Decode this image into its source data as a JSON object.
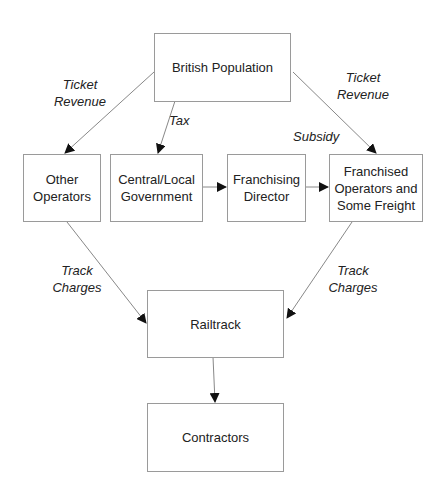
{
  "nodes": {
    "british_population": "British Population",
    "other_operators": "Other Operators",
    "government": "Central/Local Government",
    "franchising_director": "Franchising Director",
    "franchised_operators": "Franchised Operators and Some Freight",
    "railtrack": "Railtrack",
    "contractors": "Contractors"
  },
  "edge_labels": {
    "ticket_revenue_left_1": "Ticket",
    "ticket_revenue_left_2": "Revenue",
    "tax": "Tax",
    "ticket_revenue_right_1": "Ticket",
    "ticket_revenue_right_2": "Revenue",
    "subsidy": "Subsidy",
    "track_charges_left_1": "Track",
    "track_charges_left_2": "Charges",
    "track_charges_right_1": "Track",
    "track_charges_right_2": "Charges"
  },
  "edges": [
    {
      "from": "British Population",
      "to": "Other Operators",
      "label": "Ticket Revenue"
    },
    {
      "from": "British Population",
      "to": "Central/Local Government",
      "label": "Tax"
    },
    {
      "from": "British Population",
      "to": "Franchised Operators and Some Freight",
      "label": "Ticket Revenue"
    },
    {
      "from": "Central/Local Government",
      "to": "Franchising Director",
      "label": ""
    },
    {
      "from": "Franchising Director",
      "to": "Franchised Operators and Some Freight",
      "label": "Subsidy"
    },
    {
      "from": "Other Operators",
      "to": "Railtrack",
      "label": "Track Charges"
    },
    {
      "from": "Franchised Operators and Some Freight",
      "to": "Railtrack",
      "label": "Track Charges"
    },
    {
      "from": "Railtrack",
      "to": "Contractors",
      "label": ""
    }
  ]
}
